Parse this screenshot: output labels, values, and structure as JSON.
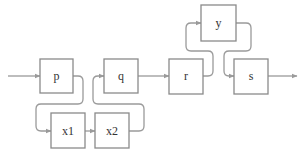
{
  "diagram": {
    "type": "block-flow",
    "colors": {
      "stroke": "#8a8a8a",
      "wire": "#9a9a9a",
      "text": "#333333",
      "background": "#ffffff"
    },
    "nodes": [
      {
        "id": "p",
        "label": "p"
      },
      {
        "id": "q",
        "label": "q"
      },
      {
        "id": "r",
        "label": "r"
      },
      {
        "id": "y",
        "label": "y"
      },
      {
        "id": "s",
        "label": "s"
      },
      {
        "id": "x1",
        "label": "x1"
      },
      {
        "id": "x2",
        "label": "x2"
      }
    ],
    "edges": [
      {
        "from": "input",
        "to": "p"
      },
      {
        "from": "p",
        "to": "x1"
      },
      {
        "from": "x1",
        "to": "x2"
      },
      {
        "from": "x2",
        "to": "q"
      },
      {
        "from": "q",
        "to": "r"
      },
      {
        "from": "r",
        "to": "y"
      },
      {
        "from": "y",
        "to": "s"
      },
      {
        "from": "s",
        "to": "output"
      }
    ]
  }
}
